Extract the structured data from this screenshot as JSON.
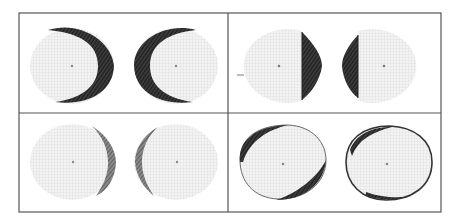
{
  "figure": {
    "width": 460,
    "height": 223,
    "frame": {
      "x": 19,
      "y": 13,
      "w": 422,
      "h": 199,
      "divider_x": 228,
      "divider_y": 113,
      "stroke": "#555555"
    },
    "colors": {
      "field_fill": "#f1f1f1",
      "grid": "#d4d4d4",
      "shade": "#2a2a2a",
      "shade_light": "#6a6a6a",
      "center_dot": "#8a8a8a"
    },
    "panels": [
      {
        "id": "top-left",
        "description": "crescent shading on outer arc of both fields",
        "fields": [
          {
            "cx": 72,
            "cy": 66,
            "rx": 42,
            "ry": 38,
            "defect": "right-crescent-heavy"
          },
          {
            "cx": 176,
            "cy": 66,
            "rx": 42,
            "ry": 38,
            "defect": "left-crescent-heavy"
          }
        ]
      },
      {
        "id": "top-right",
        "description": "half-field defects bordering vertical meridian",
        "fields": [
          {
            "cx": 280,
            "cy": 66,
            "rx": 44,
            "ry": 37,
            "defect": "right-half-segment",
            "marker": true
          },
          {
            "cx": 384,
            "cy": 66,
            "rx": 44,
            "ry": 37,
            "defect": "left-half-segment"
          }
        ]
      },
      {
        "id": "bottom-left",
        "description": "thin crescent shading on inner edge",
        "fields": [
          {
            "cx": 72,
            "cy": 162,
            "rx": 42,
            "ry": 38,
            "defect": "right-crescent-thin"
          },
          {
            "cx": 176,
            "cy": 162,
            "rx": 42,
            "ry": 38,
            "defect": "left-crescent-thin"
          }
        ]
      },
      {
        "id": "bottom-right",
        "description": "peripheral rim shading around fields",
        "fields": [
          {
            "cx": 282,
            "cy": 164,
            "rx": 44,
            "ry": 38,
            "defect": "rim-upper-left-lower-right"
          },
          {
            "cx": 386,
            "cy": 164,
            "rx": 44,
            "ry": 38,
            "defect": "rim-all-around"
          }
        ]
      }
    ]
  }
}
